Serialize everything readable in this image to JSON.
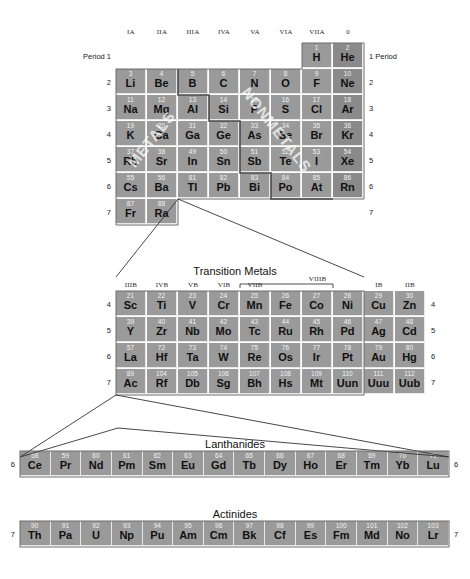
{
  "labels": {
    "period_left": "Period 1",
    "period_right": "1 Period",
    "transition_metals": "Transition Metals",
    "lanthanides": "Lanthanides",
    "actinides": "Actinides",
    "metals_watermark": "METALS",
    "nonmetals_watermark": "NONMETALS"
  },
  "colors": {
    "cell": "#9a9a9a",
    "cell_noble": "#8a8a8a",
    "cell_gap": "#e8e8e8",
    "number": "#f2f2f2",
    "symbol": "#111111",
    "background": "#ffffff",
    "outline": "#555555",
    "connector": "#333333"
  },
  "main_table": {
    "group_headers": [
      "IA",
      "IIA",
      "IIIA",
      "IVA",
      "VA",
      "VIA",
      "VIIA",
      "0"
    ],
    "period_numbers_left": [
      "Period 1",
      "2",
      "3",
      "4",
      "5",
      "6",
      "7"
    ],
    "period_numbers_right": [
      "1 Period",
      "2",
      "3",
      "4",
      "5",
      "6",
      "7"
    ],
    "rows": [
      {
        "period": "1",
        "cells": [
          null,
          null,
          null,
          null,
          null,
          null,
          {
            "z": "1",
            "s": "H",
            "noble": false
          },
          {
            "z": "2",
            "s": "He",
            "noble": true
          }
        ]
      },
      {
        "period": "2",
        "cells": [
          {
            "z": "3",
            "s": "Li",
            "noble": false
          },
          {
            "z": "4",
            "s": "Be",
            "noble": false
          },
          {
            "z": "5",
            "s": "B",
            "noble": false
          },
          {
            "z": "6",
            "s": "C",
            "noble": false
          },
          {
            "z": "7",
            "s": "N",
            "noble": false
          },
          {
            "z": "8",
            "s": "O",
            "noble": false
          },
          {
            "z": "9",
            "s": "F",
            "noble": false
          },
          {
            "z": "10",
            "s": "Ne",
            "noble": true
          }
        ]
      },
      {
        "period": "3",
        "cells": [
          {
            "z": "11",
            "s": "Na",
            "noble": false
          },
          {
            "z": "12",
            "s": "Mg",
            "noble": false
          },
          {
            "z": "13",
            "s": "Al",
            "noble": false
          },
          {
            "z": "14",
            "s": "Si",
            "noble": false
          },
          {
            "z": "15",
            "s": "P",
            "noble": false
          },
          {
            "z": "16",
            "s": "S",
            "noble": false
          },
          {
            "z": "17",
            "s": "Cl",
            "noble": false
          },
          {
            "z": "18",
            "s": "Ar",
            "noble": true
          }
        ]
      },
      {
        "period": "4",
        "cells": [
          {
            "z": "19",
            "s": "K",
            "noble": false
          },
          {
            "z": "20",
            "s": "Ca",
            "noble": false
          },
          {
            "z": "31",
            "s": "Ga",
            "noble": false
          },
          {
            "z": "32",
            "s": "Ge",
            "noble": false
          },
          {
            "z": "33",
            "s": "As",
            "noble": false
          },
          {
            "z": "34",
            "s": "Se",
            "noble": false
          },
          {
            "z": "35",
            "s": "Br",
            "noble": false
          },
          {
            "z": "36",
            "s": "Kr",
            "noble": true
          }
        ]
      },
      {
        "period": "5",
        "cells": [
          {
            "z": "37",
            "s": "Rb",
            "noble": false
          },
          {
            "z": "38",
            "s": "Sr",
            "noble": false
          },
          {
            "z": "49",
            "s": "In",
            "noble": false
          },
          {
            "z": "50",
            "s": "Sn",
            "noble": false
          },
          {
            "z": "51",
            "s": "Sb",
            "noble": false
          },
          {
            "z": "52",
            "s": "Te",
            "noble": false
          },
          {
            "z": "53",
            "s": "I",
            "noble": false
          },
          {
            "z": "54",
            "s": "Xe",
            "noble": true
          }
        ]
      },
      {
        "period": "6",
        "cells": [
          {
            "z": "55",
            "s": "Cs",
            "noble": false
          },
          {
            "z": "56",
            "s": "Ba",
            "noble": false
          },
          {
            "z": "81",
            "s": "Tl",
            "noble": false
          },
          {
            "z": "82",
            "s": "Pb",
            "noble": false
          },
          {
            "z": "83",
            "s": "Bi",
            "noble": false
          },
          {
            "z": "84",
            "s": "Po",
            "noble": false
          },
          {
            "z": "85",
            "s": "At",
            "noble": false
          },
          {
            "z": "86",
            "s": "Rn",
            "noble": true
          }
        ]
      },
      {
        "period": "7",
        "cells": [
          {
            "z": "87",
            "s": "Fr",
            "noble": false
          },
          {
            "z": "88",
            "s": "Ra",
            "noble": false
          },
          null,
          null,
          null,
          null,
          null,
          null
        ]
      }
    ]
  },
  "transition": {
    "title": "Transition Metals",
    "group_headers": [
      "IIIB",
      "IVB",
      "VB",
      "VIB",
      "VIIB",
      "",
      "",
      "",
      "IB",
      "IIB"
    ],
    "bracket_label": "VIIIB",
    "period_numbers_left": [
      "4",
      "5",
      "6",
      "7"
    ],
    "period_numbers_right": [
      "4",
      "5",
      "6",
      "7"
    ],
    "rows": [
      {
        "period": "4",
        "cells": [
          {
            "z": "21",
            "s": "Sc"
          },
          {
            "z": "22",
            "s": "Ti"
          },
          {
            "z": "23",
            "s": "V"
          },
          {
            "z": "24",
            "s": "Cr"
          },
          {
            "z": "25",
            "s": "Mn"
          },
          {
            "z": "26",
            "s": "Fe"
          },
          {
            "z": "27",
            "s": "Co"
          },
          {
            "z": "28",
            "s": "Ni"
          },
          {
            "z": "29",
            "s": "Cu"
          },
          {
            "z": "30",
            "s": "Zn"
          }
        ]
      },
      {
        "period": "5",
        "cells": [
          {
            "z": "39",
            "s": "Y"
          },
          {
            "z": "40",
            "s": "Zr"
          },
          {
            "z": "41",
            "s": "Nb"
          },
          {
            "z": "42",
            "s": "Mo"
          },
          {
            "z": "43",
            "s": "Tc"
          },
          {
            "z": "44",
            "s": "Ru"
          },
          {
            "z": "45",
            "s": "Rh"
          },
          {
            "z": "46",
            "s": "Pd"
          },
          {
            "z": "47",
            "s": "Ag"
          },
          {
            "z": "48",
            "s": "Cd"
          }
        ]
      },
      {
        "period": "6",
        "cells": [
          {
            "z": "57",
            "s": "La"
          },
          {
            "z": "72",
            "s": "Hf"
          },
          {
            "z": "73",
            "s": "Ta"
          },
          {
            "z": "74",
            "s": "W"
          },
          {
            "z": "75",
            "s": "Re"
          },
          {
            "z": "76",
            "s": "Os"
          },
          {
            "z": "77",
            "s": "Ir"
          },
          {
            "z": "78",
            "s": "Pt"
          },
          {
            "z": "79",
            "s": "Au"
          },
          {
            "z": "80",
            "s": "Hg"
          }
        ]
      },
      {
        "period": "7",
        "cells": [
          {
            "z": "89",
            "s": "Ac"
          },
          {
            "z": "104",
            "s": "Rf"
          },
          {
            "z": "105",
            "s": "Db"
          },
          {
            "z": "106",
            "s": "Sg"
          },
          {
            "z": "107",
            "s": "Bh"
          },
          {
            "z": "108",
            "s": "Hs"
          },
          {
            "z": "109",
            "s": "Mt"
          },
          {
            "z": "110",
            "s": "Uun"
          },
          {
            "z": "111",
            "s": "Uuu"
          },
          {
            "z": "112",
            "s": "Uub"
          }
        ]
      }
    ]
  },
  "lanthanides": {
    "title": "Lanthanides",
    "period_left": "6",
    "period_right": "6",
    "cells": [
      {
        "z": "58",
        "s": "Ce"
      },
      {
        "z": "59",
        "s": "Pr"
      },
      {
        "z": "60",
        "s": "Nd"
      },
      {
        "z": "61",
        "s": "Pm"
      },
      {
        "z": "62",
        "s": "Sm"
      },
      {
        "z": "63",
        "s": "Eu"
      },
      {
        "z": "64",
        "s": "Gd"
      },
      {
        "z": "65",
        "s": "Tb"
      },
      {
        "z": "66",
        "s": "Dy"
      },
      {
        "z": "67",
        "s": "Ho"
      },
      {
        "z": "68",
        "s": "Er"
      },
      {
        "z": "69",
        "s": "Tm"
      },
      {
        "z": "70",
        "s": "Yb"
      },
      {
        "z": "71",
        "s": "Lu"
      }
    ]
  },
  "actinides": {
    "title": "Actinides",
    "period_left": "7",
    "period_right": "7",
    "cells": [
      {
        "z": "90",
        "s": "Th"
      },
      {
        "z": "91",
        "s": "Pa"
      },
      {
        "z": "92",
        "s": "U"
      },
      {
        "z": "93",
        "s": "Np"
      },
      {
        "z": "94",
        "s": "Pu"
      },
      {
        "z": "95",
        "s": "Am"
      },
      {
        "z": "96",
        "s": "Cm"
      },
      {
        "z": "97",
        "s": "Bk"
      },
      {
        "z": "98",
        "s": "Cf"
      },
      {
        "z": "99",
        "s": "Es"
      },
      {
        "z": "100",
        "s": "Fm"
      },
      {
        "z": "101",
        "s": "Md"
      },
      {
        "z": "102",
        "s": "No"
      },
      {
        "z": "103",
        "s": "Lr"
      }
    ]
  }
}
